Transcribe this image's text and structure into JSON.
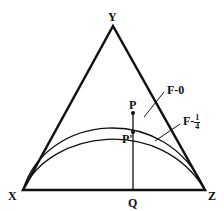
{
  "diagram": {
    "type": "ternary-triangle",
    "vertices": {
      "top": "Y",
      "left": "X",
      "right": "Z"
    },
    "points": {
      "upper": "P",
      "lower": "P'",
      "base": "Q"
    },
    "curves": [
      {
        "label_prefix": "F",
        "label_sep": "-",
        "value": "0"
      },
      {
        "label_prefix": "F",
        "label_sep": "-",
        "value_num": "1",
        "value_den": "4"
      }
    ]
  }
}
